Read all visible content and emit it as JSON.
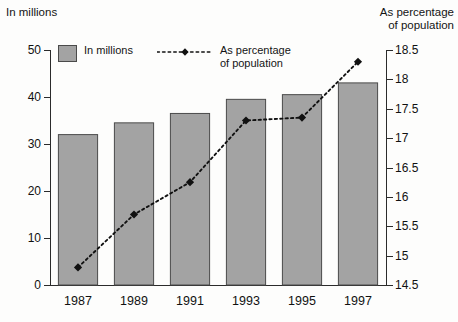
{
  "chart_data": {
    "type": "bar",
    "title": "",
    "categories": [
      "1987",
      "1989",
      "1991",
      "1993",
      "1995",
      "1997"
    ],
    "series": [
      {
        "name": "In millions",
        "type": "bar",
        "axis": "left",
        "values": [
          32,
          34.5,
          36.5,
          39.5,
          40.5,
          43
        ]
      },
      {
        "name": "As percentage of population",
        "type": "line",
        "axis": "right",
        "values": [
          14.8,
          15.7,
          16.25,
          17.3,
          17.35,
          18.3
        ]
      }
    ],
    "xlabel": "",
    "ylabel": "In millions",
    "y2label": "As percentage of population",
    "ylim": [
      0,
      50
    ],
    "y2lim": [
      14.5,
      18.5
    ],
    "yticks": [
      0,
      10,
      20,
      30,
      40,
      50
    ],
    "y2ticks": [
      14.5,
      15,
      15.5,
      16,
      16.5,
      17,
      17.5,
      18,
      18.5
    ],
    "grid": false,
    "legend_position": "top"
  },
  "axes": {
    "left_title": "In millions",
    "right_title": "As percentage\nof population",
    "left_ticks": [
      "0",
      "10",
      "20",
      "30",
      "40",
      "50"
    ],
    "right_ticks": [
      "14.5",
      "15",
      "15.5",
      "16",
      "16.5",
      "17",
      "17.5",
      "18",
      "18.5"
    ],
    "categories": [
      "1987",
      "1989",
      "1991",
      "1993",
      "1995",
      "1997"
    ]
  },
  "legend": {
    "bar_label": "In millions",
    "line_label": "As percentage\nof population"
  },
  "colors": {
    "bar_fill": "#a3a3a3",
    "bar_stroke": "#4a4a4a",
    "line": "#111111",
    "axis": "#2b2b2b",
    "background": "#fdfdfc"
  }
}
